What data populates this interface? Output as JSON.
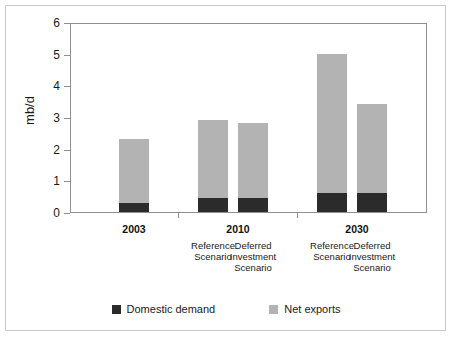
{
  "chart_data": {
    "type": "bar",
    "stacked": true,
    "title": "",
    "xlabel": "",
    "ylabel": "mb/d",
    "ylim": [
      0,
      6
    ],
    "yticks": [
      "0",
      "1",
      "2",
      "3",
      "4",
      "5",
      "6"
    ],
    "grid": false,
    "legend_position": "bottom",
    "categories": [
      "2003",
      "2010 Reference Scenario",
      "2010 Deferred Investment Scenario",
      "2030 Reference Scenario",
      "2030 Deferred Investment Scenario"
    ],
    "groups": [
      {
        "year": "2003",
        "bars": [
          {
            "scenario": "",
            "domestic_demand": 0.3,
            "net_exports": 2.0,
            "total": 2.3
          }
        ]
      },
      {
        "year": "2010",
        "bars": [
          {
            "scenario": "Reference\nScenario",
            "domestic_demand": 0.45,
            "net_exports": 2.45,
            "total": 2.9
          },
          {
            "scenario": "Deferred\nInvestment\nScenario",
            "domestic_demand": 0.45,
            "net_exports": 2.35,
            "total": 2.8
          }
        ]
      },
      {
        "year": "2030",
        "bars": [
          {
            "scenario": "Reference\nScenario",
            "domestic_demand": 0.6,
            "net_exports": 4.4,
            "total": 5.0
          },
          {
            "scenario": "Deferred\nInvestment\nScenario",
            "domestic_demand": 0.6,
            "net_exports": 2.8,
            "total": 3.4
          }
        ]
      }
    ],
    "series": [
      {
        "name": "Domestic demand",
        "color": "#2b2b2b",
        "values": [
          0.3,
          0.45,
          0.45,
          0.6,
          0.6
        ]
      },
      {
        "name": "Net exports",
        "color": "#b3b3b3",
        "values": [
          2.0,
          2.45,
          2.35,
          4.4,
          2.8
        ]
      }
    ],
    "totals": [
      2.3,
      2.9,
      2.8,
      5.0,
      3.4
    ]
  },
  "axis": {
    "y_title": "mb/d",
    "y_ticks": [
      "6",
      "5",
      "4",
      "3",
      "2",
      "1",
      "0"
    ]
  },
  "groups": [
    {
      "year": "2003",
      "scenarios": []
    },
    {
      "year": "2010",
      "scenarios": [
        {
          "line1": "Reference",
          "line2": "Scenario",
          "line3": ""
        },
        {
          "line1": "Deferred",
          "line2": "Investment",
          "line3": "Scenario"
        }
      ]
    },
    {
      "year": "2030",
      "scenarios": [
        {
          "line1": "Reference",
          "line2": "Scenario",
          "line3": ""
        },
        {
          "line1": "Deferred",
          "line2": "Investment",
          "line3": "Scenario"
        }
      ]
    }
  ],
  "legend": {
    "items": [
      {
        "label": "Domestic demand",
        "color": "#2b2b2b"
      },
      {
        "label": "Net exports",
        "color": "#b3b3b3"
      }
    ]
  },
  "colors": {
    "domestic_demand": "#2b2b2b",
    "net_exports": "#b3b3b3",
    "axis": "#8f8f8f",
    "frame": "#c9c9c9",
    "text": "#1a1a1a"
  }
}
